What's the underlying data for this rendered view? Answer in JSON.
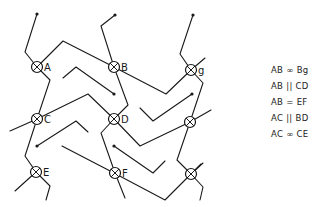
{
  "diagram": {
    "nodes": [
      {
        "id": "A",
        "label": "A",
        "x": 37,
        "y": 67
      },
      {
        "id": "B",
        "label": "B",
        "x": 114,
        "y": 67
      },
      {
        "id": "g",
        "label": "g",
        "x": 191,
        "y": 70
      },
      {
        "id": "C",
        "label": "C",
        "x": 37,
        "y": 119
      },
      {
        "id": "D",
        "label": "D",
        "x": 114,
        "y": 119
      },
      {
        "id": "R1",
        "label": "",
        "x": 190,
        "y": 122
      },
      {
        "id": "E",
        "label": "E",
        "x": 36,
        "y": 172
      },
      {
        "id": "F",
        "label": "F",
        "x": 115,
        "y": 173
      },
      {
        "id": "R2",
        "label": "",
        "x": 191,
        "y": 174
      }
    ],
    "paths": [
      "M37,14 L25,52 L37,67 L63,41 L114,67 L166,94 L191,70",
      "M37,67 L50,80 L37,119 L25,156 L36,172",
      "M115,15 L101,26 L114,67 L128,105 L114,119 L101,133 L115,173 L125,198",
      "M193,15 L180,54 L191,70 L203,83 L190,122 L177,160 L191,174 L203,187 L200,200",
      "M10,131 L37,119 L88,94 L114,119 L140,146 L190,122 L211,110",
      "M63,78 L76,67 L114,94",
      "M37,146 L76,121 L88,132",
      "M140,108 L153,121 L192,94",
      "M114,146 L153,173 L165,161",
      "M62,146 L114,173 L165,200 L191,174 L203,163",
      "M15,191 L36,172 L50,186 L46,200",
      "M191,70 L205,58",
      "M191,174 L201,164"
    ],
    "endpoints": [
      {
        "x": 37,
        "y": 14
      },
      {
        "x": 115,
        "y": 15
      },
      {
        "x": 193,
        "y": 15
      },
      {
        "x": 114,
        "y": 94
      },
      {
        "x": 192,
        "y": 94
      },
      {
        "x": 37,
        "y": 146
      },
      {
        "x": 114,
        "y": 146
      }
    ]
  },
  "legend": {
    "rows": [
      "AB ∞ Bg",
      "AB || CD",
      "AB = EF",
      "AC || BD",
      "AC ∞ CE"
    ]
  }
}
